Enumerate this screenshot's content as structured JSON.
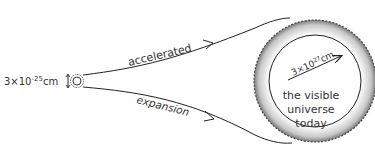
{
  "diagram": {
    "initial_size_label": "3×10",
    "initial_size_exp": "-25",
    "initial_size_unit": "cm",
    "arrow_top_label": "accelerated",
    "arrow_bottom_label": "expansion",
    "radius_label": "3×10",
    "radius_exp": "27",
    "radius_unit": "cm",
    "universe_label_line1": "the visible",
    "universe_label_line2": "universe",
    "universe_label_line3": "today",
    "colors": {
      "line": "#222222",
      "text": "#333333",
      "ring_light": "#f2f2f2",
      "ring_dark": "#8a8a8a"
    }
  }
}
